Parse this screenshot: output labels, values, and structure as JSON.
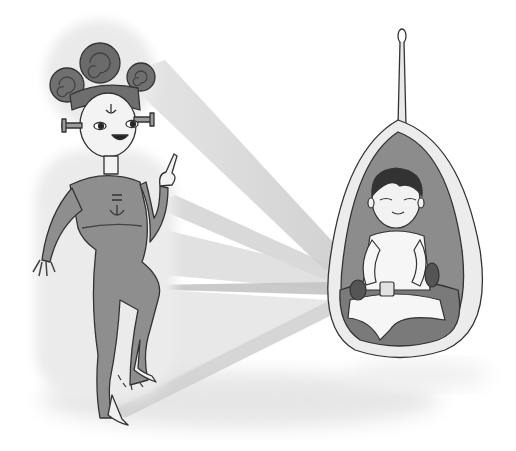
{
  "scene": {
    "description": "Grayscale illustration: an alien girl with swirl hair buns and neck bolts dances on one foot, projecting light beams toward a boy sitting cross-legged inside a hanging egg-shaped pod chair.",
    "colors": {
      "background": "#ffffff",
      "suit": "#8e8e8e",
      "suit_dark": "#6a6a6a",
      "hair": "#6e6e6e",
      "skin": "#f2f2f2",
      "beam": "#d6d6d6",
      "beam_dark": "#b9b9b9",
      "pod_outer": "#ececec",
      "pod_inner": "#8c8c8c",
      "cushion": "#7a7a7a",
      "outline": "#333333",
      "shadow": "#e4e4e4"
    }
  }
}
